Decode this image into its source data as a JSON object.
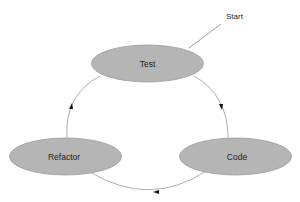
{
  "diagram": {
    "type": "cycle",
    "title": "",
    "start_label": "Start",
    "nodes": [
      {
        "id": "test",
        "label": "Test"
      },
      {
        "id": "code",
        "label": "Code"
      },
      {
        "id": "refactor",
        "label": "Refactor"
      }
    ],
    "edges": [
      {
        "from": "test",
        "to": "code"
      },
      {
        "from": "code",
        "to": "refactor"
      },
      {
        "from": "refactor",
        "to": "test"
      }
    ],
    "start_points_to": "test",
    "colors": {
      "node_fill": "#b5b5b5",
      "node_stroke": "#9a9a9a",
      "edge": "#8c8c8c",
      "arrowhead": "#111111",
      "text": "#222222",
      "background": "#ffffff"
    }
  }
}
